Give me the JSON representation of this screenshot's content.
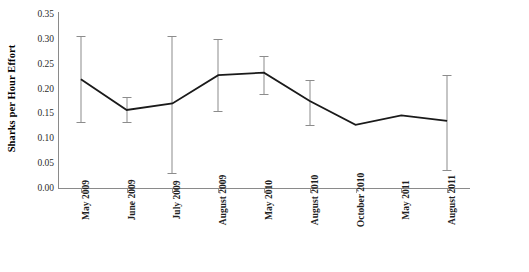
{
  "chart_data": {
    "type": "line",
    "title": "",
    "xlabel": "",
    "ylabel": "Sharks per Hour Effort",
    "ylim": [
      0.0,
      0.35
    ],
    "yticks": [
      0.0,
      0.05,
      0.1,
      0.15,
      0.2,
      0.25,
      0.3,
      0.35
    ],
    "ytick_labels": [
      "0.00",
      "0.05",
      "0.10",
      "0.15",
      "0.20",
      "0.25",
      "0.30",
      "0.35"
    ],
    "grid": false,
    "legend": "none",
    "categories": [
      "May 2009",
      "June 2009",
      "July 2009",
      "August 2009",
      "May 2010",
      "August 2010",
      "October 2010",
      "May 2011",
      "August 2011"
    ],
    "values": [
      0.219,
      0.157,
      0.17,
      0.227,
      0.232,
      0.175,
      0.127,
      0.146,
      0.135
    ],
    "error_low": [
      0.132,
      0.133,
      0.03,
      0.155,
      0.19,
      0.127,
      null,
      null,
      0.037
    ],
    "error_high": [
      0.305,
      0.183,
      0.305,
      0.3,
      0.265,
      0.217,
      null,
      null,
      0.228
    ],
    "series": [
      {
        "name": "Sharks per Hour Effort",
        "values": [
          0.219,
          0.157,
          0.17,
          0.227,
          0.232,
          0.175,
          0.127,
          0.146,
          0.135
        ]
      }
    ],
    "line_color": "#1a1a1a",
    "errorbar_color": "#8c8c8c",
    "axis_color": "#8a8a8a"
  }
}
